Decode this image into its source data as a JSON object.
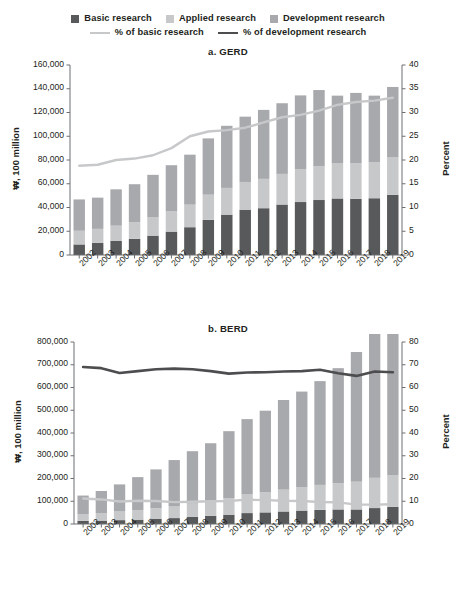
{
  "legend": {
    "row1": [
      {
        "label": "Basic research",
        "marker": "square",
        "color": "#58595b",
        "name": "legend-basic-research"
      },
      {
        "label": "Applied research",
        "marker": "square",
        "color": "#c7c8ca",
        "name": "legend-applied-research"
      },
      {
        "label": "Development research",
        "marker": "square",
        "color": "#a7a9ac",
        "name": "legend-development-research"
      }
    ],
    "row2": [
      {
        "label": "% of basic research",
        "marker": "line",
        "color": "#c7c8ca",
        "name": "legend-pct-basic-research"
      },
      {
        "label": "% of development research",
        "marker": "line",
        "color": "#4d4d4f",
        "name": "legend-pct-development-research"
      }
    ]
  },
  "chart_data": [
    {
      "id": "gerd",
      "type": "bar",
      "title": "a. GERD",
      "xlabel": "",
      "ylabel": "₩, 100 million",
      "y2label": "Percent",
      "ylim": [
        0,
        160000
      ],
      "yticks": [
        0,
        20000,
        40000,
        60000,
        80000,
        100000,
        120000,
        140000,
        160000
      ],
      "yticklabels": [
        "0",
        "20,000",
        "40,000",
        "60,000",
        "80,000",
        "100,000",
        "120,000",
        "140,000",
        "160,000"
      ],
      "y2lim": [
        0,
        40
      ],
      "y2ticks": [
        0,
        5,
        10,
        15,
        20,
        25,
        30,
        35,
        40
      ],
      "y2ticklabels": [
        "0",
        "5",
        "10",
        "15",
        "20",
        "25",
        "30",
        "35",
        "40"
      ],
      "grid": false,
      "legend_position": "top",
      "stacked": true,
      "categories": [
        "2002",
        "2003",
        "2004",
        "2005",
        "2006",
        "2007",
        "2008",
        "2009",
        "2010",
        "2011",
        "2012",
        "2013",
        "2014",
        "2015",
        "2016",
        "2017",
        "2018",
        "2019"
      ],
      "series": [
        {
          "name": "Basic research",
          "color": "#58595b",
          "values": [
            8900,
            10200,
            11800,
            13600,
            16300,
            19700,
            23400,
            29600,
            34000,
            37900,
            39400,
            42500,
            44600,
            46300,
            47600,
            47300,
            47800,
            50600
          ]
        },
        {
          "name": "Applied research",
          "color": "#c7c8ca",
          "values": [
            11500,
            11800,
            12900,
            14000,
            15700,
            17300,
            19000,
            21200,
            22500,
            23600,
            24700,
            25800,
            27500,
            28600,
            29500,
            29900,
            30300,
            31900
          ]
        },
        {
          "name": "Development research",
          "color": "#a7a9ac",
          "values": [
            26400,
            26300,
            30600,
            32000,
            35500,
            38600,
            42100,
            47400,
            52300,
            55000,
            58100,
            59500,
            62300,
            64000,
            57100,
            59300,
            56100,
            59000
          ]
        }
      ],
      "lines": [
        {
          "name": "% of basic research",
          "color": "#c7c8ca",
          "axis": "right",
          "values": [
            18.8,
            19.0,
            20.0,
            20.3,
            21.0,
            22.5,
            25.0,
            26.0,
            26.3,
            26.8,
            27.9,
            29.0,
            29.5,
            30.4,
            31.6,
            32.2,
            32.5,
            33.1
          ]
        }
      ]
    },
    {
      "id": "berd",
      "type": "bar",
      "title": "b. BERD",
      "xlabel": "",
      "ylabel": "₩, 100 million",
      "y2label": "Percent",
      "ylim": [
        0,
        800000
      ],
      "yticks": [
        0,
        100000,
        200000,
        300000,
        400000,
        500000,
        600000,
        700000,
        800000
      ],
      "yticklabels": [
        "0",
        "100,000",
        "200,000",
        "300,000",
        "400,000",
        "500,000",
        "600,000",
        "700,000",
        "800,000"
      ],
      "y2lim": [
        0,
        80
      ],
      "y2ticks": [
        0,
        10,
        20,
        30,
        40,
        50,
        60,
        70,
        80
      ],
      "y2ticklabels": [
        "0",
        "10",
        "20",
        "30",
        "40",
        "50",
        "60",
        "70",
        "80"
      ],
      "grid": false,
      "legend_position": "top",
      "stacked": true,
      "categories": [
        "2002",
        "2003",
        "2004",
        "2005",
        "2006",
        "2007",
        "2008",
        "2009",
        "2010",
        "2011",
        "2012",
        "2013",
        "2014",
        "2015",
        "2016",
        "2017",
        "2018",
        "2019"
      ],
      "series": [
        {
          "name": "Basic research",
          "color": "#58595b",
          "values": [
            14000,
            15000,
            17000,
            19000,
            22000,
            26000,
            31000,
            36000,
            41000,
            48000,
            51000,
            55000,
            59000,
            62000,
            64000,
            64000,
            70000,
            75000
          ]
        },
        {
          "name": "Applied research",
          "color": "#c7c8ca",
          "values": [
            30000,
            33000,
            38000,
            42000,
            47000,
            53000,
            59000,
            66000,
            73000,
            82000,
            88000,
            96000,
            103000,
            110000,
            115000,
            122000,
            133000,
            140000
          ]
        },
        {
          "name": "Development research",
          "color": "#a7a9ac",
          "values": [
            81000,
            97000,
            119000,
            145000,
            171000,
            202000,
            230000,
            253000,
            294000,
            331000,
            359000,
            394000,
            420000,
            456000,
            506000,
            570000,
            637000,
            639000
          ]
        }
      ],
      "lines": [
        {
          "name": "% of basic research",
          "color": "#c7c8ca",
          "axis": "right",
          "values": [
            11.2,
            10.8,
            9.9,
            10.2,
            10.1,
            9.6,
            9.8,
            10.0,
            10.1,
            10.7,
            10.5,
            10.2,
            10.1,
            9.7,
            9.5,
            8.5,
            8.5,
            8.7
          ]
        }
      ],
      "lines_dark": [
        {
          "name": "% of development research",
          "color": "#4d4d4f",
          "axis": "right",
          "values": [
            69.0,
            68.5,
            66.4,
            67.2,
            68.0,
            68.3,
            68.0,
            67.2,
            66.1,
            66.6,
            66.7,
            67.0,
            67.2,
            67.8,
            66.3,
            65.1,
            67.0,
            66.7
          ]
        }
      ]
    }
  ]
}
